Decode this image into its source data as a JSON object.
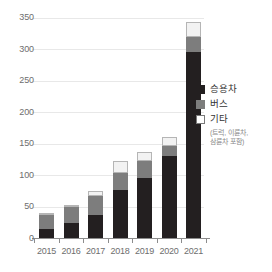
{
  "chart_data": {
    "type": "bar",
    "stacked": true,
    "title": "",
    "xlabel": "",
    "ylabel": "",
    "categories": [
      "2015",
      "2016",
      "2017",
      "2018",
      "2019",
      "2020",
      "2021"
    ],
    "series": [
      {
        "name": "승용차",
        "color": "#231f20",
        "values": [
          15,
          24,
          37,
          77,
          96,
          131,
          296
        ]
      },
      {
        "name": "버스",
        "color": "#7d7d7d",
        "values": [
          22,
          26,
          30,
          27,
          26,
          16,
          24
        ]
      },
      {
        "name": "기타",
        "color": "#f2f2f2",
        "values": [
          3,
          3,
          7,
          18,
          15,
          13,
          24
        ]
      }
    ],
    "totals": [
      40,
      53,
      74,
      122,
      137,
      160,
      344
    ],
    "ylim": [
      0,
      350
    ],
    "yticks": [
      0,
      50,
      100,
      150,
      200,
      250,
      300,
      350
    ],
    "ytick_labels": [
      "0",
      "50",
      "100",
      "150",
      "200",
      "250",
      "300",
      "350"
    ],
    "grid": true,
    "legend_position": "right"
  },
  "legend": {
    "items": [
      {
        "label": "승용차",
        "swatch": "passenger-swatch",
        "note": ""
      },
      {
        "label": "버스",
        "swatch": "bus-swatch",
        "note": ""
      },
      {
        "label": "기타",
        "swatch": "other-swatch",
        "note_line1": "(트럭, 이륜차,",
        "note_line2": "삼륜차 포함)"
      }
    ]
  },
  "axis": {
    "y_max_label": "350",
    "y_min_label": "0"
  }
}
